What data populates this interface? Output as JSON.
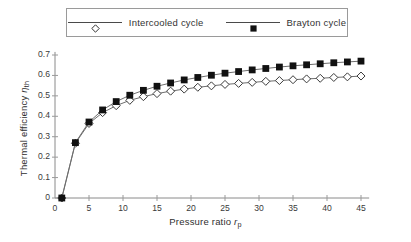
{
  "chart_data": {
    "type": "line",
    "title": "",
    "xlabel": "Pressure ratio r_p",
    "ylabel": "Thermal efficiency η_th",
    "xlim": [
      0,
      46
    ],
    "ylim": [
      0,
      0.72
    ],
    "xticks": [
      0,
      5,
      10,
      15,
      20,
      25,
      30,
      35,
      40,
      45
    ],
    "yticks": [
      0,
      0.1,
      0.2,
      0.3,
      0.4,
      0.5,
      0.6,
      0.7
    ],
    "ytick_labels": [
      "0",
      "0.1",
      "0.2",
      "0.3",
      "0.4",
      "0.5",
      "0.6",
      "0.7"
    ],
    "xtick_labels": [
      "0",
      "5",
      "10",
      "15",
      "20",
      "25",
      "30",
      "35",
      "40",
      "45"
    ],
    "grid": false,
    "legend_position": "top-center",
    "x": [
      1,
      3,
      5,
      7,
      9,
      11,
      13,
      15,
      17,
      19,
      21,
      23,
      25,
      27,
      29,
      31,
      33,
      35,
      37,
      39,
      41,
      43,
      45
    ],
    "series": [
      {
        "name": "Intercooled cycle",
        "marker": "open-diamond",
        "color": "#222222",
        "values": [
          0.0,
          0.268,
          0.365,
          0.418,
          0.452,
          0.478,
          0.496,
          0.511,
          0.523,
          0.533,
          0.542,
          0.549,
          0.556,
          0.561,
          0.566,
          0.571,
          0.575,
          0.579,
          0.583,
          0.586,
          0.59,
          0.593,
          0.597
        ]
      },
      {
        "name": "Brayton cycle",
        "marker": "filled-square",
        "color": "#111111",
        "values": [
          0.0,
          0.271,
          0.372,
          0.431,
          0.472,
          0.503,
          0.527,
          0.547,
          0.563,
          0.578,
          0.59,
          0.601,
          0.611,
          0.619,
          0.627,
          0.634,
          0.641,
          0.647,
          0.652,
          0.657,
          0.662,
          0.666,
          0.67
        ]
      }
    ]
  },
  "legend": {
    "entries": [
      {
        "label": "Intercooled cycle",
        "marker": "open-diamond"
      },
      {
        "label": "Brayton cycle",
        "marker": "filled-square"
      }
    ]
  },
  "axes": {
    "x_title_main": "Pressure ratio",
    "x_title_symbol": "r",
    "x_title_sub": "p",
    "y_title_main": "Thermal efficiency",
    "y_title_symbol": "η",
    "y_title_sub": "th"
  }
}
